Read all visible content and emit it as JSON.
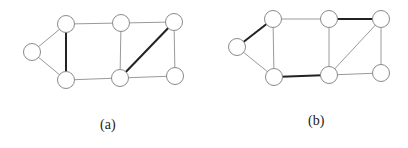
{
  "panels": [
    {
      "id": "a",
      "caption": "(a)",
      "caption_pos": [
        100,
        117
      ],
      "nodes": [
        {
          "id": "L",
          "x": 32,
          "y": 52
        },
        {
          "id": "TL",
          "x": 66,
          "y": 24
        },
        {
          "id": "BL",
          "x": 66,
          "y": 80
        },
        {
          "id": "TM",
          "x": 121,
          "y": 23
        },
        {
          "id": "BM",
          "x": 120,
          "y": 78
        },
        {
          "id": "TR",
          "x": 174,
          "y": 22
        },
        {
          "id": "BR",
          "x": 175,
          "y": 76
        }
      ],
      "edges": [
        {
          "from": "L",
          "to": "TL",
          "bold": false
        },
        {
          "from": "L",
          "to": "BL",
          "bold": false
        },
        {
          "from": "TL",
          "to": "BL",
          "bold": true
        },
        {
          "from": "TL",
          "to": "TM",
          "bold": false
        },
        {
          "from": "BL",
          "to": "BM",
          "bold": false
        },
        {
          "from": "TM",
          "to": "BM",
          "bold": false
        },
        {
          "from": "TM",
          "to": "TR",
          "bold": false
        },
        {
          "from": "BM",
          "to": "TR",
          "bold": true
        },
        {
          "from": "BM",
          "to": "BR",
          "bold": false
        },
        {
          "from": "TR",
          "to": "BR",
          "bold": false
        }
      ]
    },
    {
      "id": "b",
      "caption": "(b)",
      "caption_pos": [
        308,
        113
      ],
      "nodes": [
        {
          "id": "L",
          "x": 237,
          "y": 47
        },
        {
          "id": "TL",
          "x": 273,
          "y": 19
        },
        {
          "id": "BL",
          "x": 274,
          "y": 77
        },
        {
          "id": "TM",
          "x": 329,
          "y": 19
        },
        {
          "id": "BM",
          "x": 329,
          "y": 75
        },
        {
          "id": "TR",
          "x": 381,
          "y": 19
        },
        {
          "id": "BR",
          "x": 381,
          "y": 73
        }
      ],
      "edges": [
        {
          "from": "L",
          "to": "TL",
          "bold": true
        },
        {
          "from": "L",
          "to": "BL",
          "bold": false
        },
        {
          "from": "TL",
          "to": "BL",
          "bold": false
        },
        {
          "from": "TL",
          "to": "TM",
          "bold": false
        },
        {
          "from": "BL",
          "to": "BM",
          "bold": true
        },
        {
          "from": "TM",
          "to": "BM",
          "bold": false
        },
        {
          "from": "TM",
          "to": "TR",
          "bold": true
        },
        {
          "from": "BM",
          "to": "TR",
          "bold": false
        },
        {
          "from": "BM",
          "to": "BR",
          "bold": false
        },
        {
          "from": "TR",
          "to": "BR",
          "bold": false
        }
      ]
    }
  ],
  "node_radius": 8.5
}
